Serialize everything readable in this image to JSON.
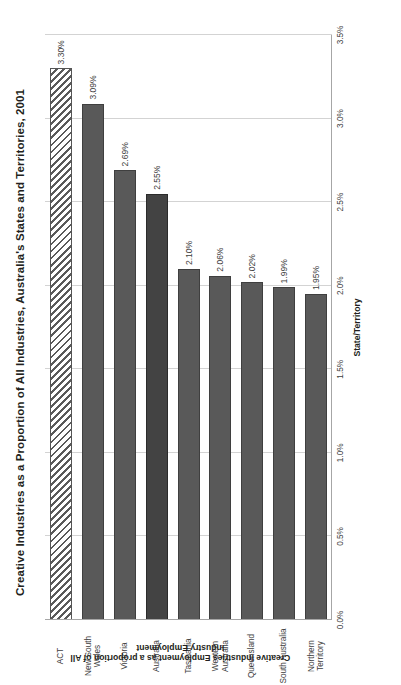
{
  "chart_data": {
    "type": "bar",
    "orientation": "vertical",
    "title": "Creative Industries as a Proportion of All Industries, Australia's States and Territories, 2001",
    "xlabel": "State/Territory",
    "ylabel": "Creative Industries Employment as a proportion of All Industry Employment",
    "categories": [
      "ACT",
      "New South Wales",
      "Victoria",
      "Australia",
      "Tasmania",
      "Western Australia",
      "Queensland",
      "South Australia",
      "Northern Territory"
    ],
    "values": [
      3.3,
      3.09,
      2.69,
      2.55,
      2.1,
      2.06,
      2.02,
      1.99,
      1.95
    ],
    "value_labels": [
      "3.30%",
      "3.09%",
      "2.69%",
      "2.55%",
      "2.10%",
      "2.06%",
      "2.02%",
      "1.99%",
      "1.95%"
    ],
    "ylim": [
      0.0,
      3.5
    ],
    "ytick_labels": [
      "0.0%",
      "0.5%",
      "1.0%",
      "1.5%",
      "2.0%",
      "2.5%",
      "3.0%",
      "3.5%"
    ],
    "ytick_values": [
      0.0,
      0.5,
      1.0,
      1.5,
      2.0,
      2.5,
      3.0,
      3.5
    ],
    "grid": true,
    "legend": null,
    "bar_styles": [
      "hatched",
      "solid",
      "solid",
      "highlight",
      "solid",
      "solid",
      "solid",
      "solid",
      "solid"
    ],
    "colors": {
      "bar": "#595959",
      "bar_highlight": "#434343",
      "bar_hatch_line": "#5a5a5a",
      "bar_hatch_background": "#ffffff",
      "gridline": "#d3d3d3",
      "axis": "#a6a6a6",
      "text": "#231f20",
      "background": "#ffffff"
    }
  },
  "figure": {
    "rotation": "page content rendered rotated 90 degrees counter-clockwise"
  }
}
